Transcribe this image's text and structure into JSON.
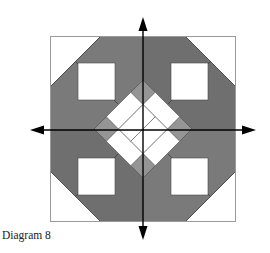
{
  "caption": "Diagram 8",
  "colors": {
    "background": "#ffffff",
    "outline": "#9a9a9a",
    "dark_gray": "#6c6c6c",
    "mid_gray": "#777777",
    "light_gray": "#959595",
    "white": "#ffffff",
    "arrow": "#000000",
    "seam": "#3a3a3a"
  },
  "block": {
    "x": 50,
    "y": 36,
    "size": 186,
    "center": [
      143,
      129
    ]
  },
  "arrows": [
    {
      "direction": "up",
      "tip": [
        143,
        17
      ]
    },
    {
      "direction": "down",
      "tip": [
        143,
        240
      ]
    },
    {
      "direction": "left",
      "tip": [
        30,
        130
      ]
    },
    {
      "direction": "right",
      "tip": [
        256,
        130
      ]
    }
  ]
}
